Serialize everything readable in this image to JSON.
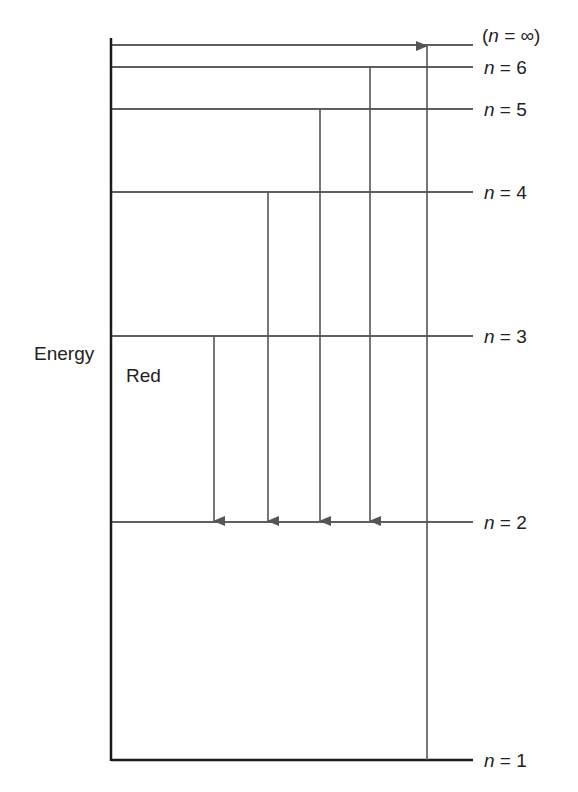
{
  "diagram": {
    "axis_label": "Energy",
    "series_label": "Red",
    "levels": [
      {
        "n": "∞",
        "label": "(n = ∞)",
        "y": 45
      },
      {
        "n": "6",
        "label": "n = 6",
        "y": 67
      },
      {
        "n": "5",
        "label": "n = 5",
        "y": 109
      },
      {
        "n": "4",
        "label": "n = 4",
        "y": 192
      },
      {
        "n": "3",
        "label": "n = 3",
        "y": 336
      },
      {
        "n": "2",
        "label": "n = 2",
        "y": 522
      },
      {
        "n": "1",
        "label": "n = 1",
        "y": 760
      }
    ],
    "transitions": [
      {
        "from": 3,
        "to": 2,
        "x": 214,
        "direction": "down"
      },
      {
        "from": 4,
        "to": 2,
        "x": 268,
        "direction": "down"
      },
      {
        "from": 5,
        "to": 2,
        "x": 320,
        "direction": "down"
      },
      {
        "from": 6,
        "to": 2,
        "x": 370,
        "direction": "down"
      },
      {
        "from": 1,
        "to": "∞",
        "x": 427,
        "direction": "up"
      }
    ],
    "colors": {
      "line": "#2a2a2a",
      "arrow": "#555555",
      "text": "#222222"
    }
  }
}
